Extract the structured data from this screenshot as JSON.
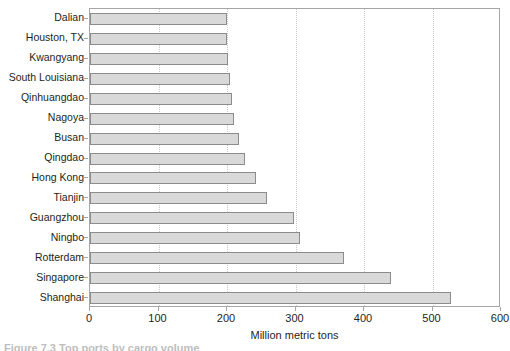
{
  "chart_data": {
    "type": "bar",
    "orientation": "horizontal",
    "title": "",
    "xlabel": "Million metric tons",
    "ylabel": "",
    "xlim": [
      0,
      600
    ],
    "ylim": null,
    "grid": "vertical-dotted",
    "legend": null,
    "xticks": [
      0,
      100,
      200,
      300,
      400,
      500,
      600
    ],
    "xtick_labels": [
      "0",
      "100",
      "200",
      "300",
      "400",
      "500",
      "600"
    ],
    "categories": [
      "Dalian",
      "Houston, TX",
      "Kwangyang",
      "South Louisiana",
      "Qinhuangdao",
      "Nagoya",
      "Busan",
      "Qingdao",
      "Hong Kong",
      "Tianjin",
      "Guangzhou",
      "Ningbo",
      "Rotterdam",
      "Singapore",
      "Shanghai"
    ],
    "values": [
      200,
      200,
      202,
      205,
      207,
      210,
      218,
      226,
      243,
      258,
      298,
      306,
      371,
      440,
      527
    ],
    "bar_color": "#d9d9d9",
    "bar_edge_color": "#8c8c8c",
    "axis_color": "#a6a6a6"
  },
  "figure": {
    "caption_partial": "Figure 7.3  Top ports by cargo volume"
  }
}
